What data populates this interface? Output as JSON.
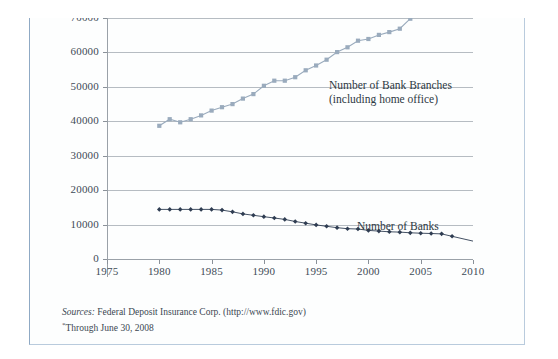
{
  "chart_data": {
    "type": "line",
    "title": "",
    "xlabel": "",
    "ylabel": "",
    "xlim": [
      1975,
      2010
    ],
    "ylim": [
      0,
      75000
    ],
    "y_axis_display_max": 70000,
    "grid": true,
    "legend_position": "inline-annotation",
    "x_ticks": [
      1975,
      1980,
      1985,
      1990,
      1995,
      2000,
      2005,
      2010
    ],
    "y_ticks": [
      0,
      10000,
      20000,
      30000,
      40000,
      50000,
      60000,
      70000
    ],
    "x_tick_labels": [
      "1975",
      "1980",
      "1985",
      "1990",
      "1995",
      "2000",
      "2005",
      "2010"
    ],
    "y_tick_labels": [
      "0",
      "10000",
      "20000",
      "30000",
      "40000",
      "50000",
      "60000",
      "70000"
    ],
    "x": [
      1980,
      1981,
      1982,
      1983,
      1984,
      1985,
      1986,
      1987,
      1988,
      1989,
      1990,
      1991,
      1992,
      1993,
      1994,
      1995,
      1996,
      1997,
      1998,
      1999,
      2000,
      2001,
      2002,
      2003,
      2004,
      2005,
      2006,
      2007,
      2008
    ],
    "series": [
      {
        "name": "Number of Bank Branches (including home office)",
        "color": "#9aabbd",
        "marker": "square",
        "values": [
          38700,
          40600,
          39700,
          40600,
          41700,
          43100,
          44100,
          45000,
          46600,
          47900,
          50300,
          51800,
          51800,
          52800,
          54800,
          56200,
          57900,
          60100,
          61500,
          63400,
          63900,
          65100,
          65900,
          66900,
          69800,
          72500,
          73400,
          75000,
          76000
        ]
      },
      {
        "name": "Number of Banks",
        "color": "#2f3d52",
        "marker": "diamond",
        "values": [
          14400,
          14400,
          14400,
          14400,
          14400,
          14400,
          14200,
          13700,
          13100,
          12700,
          12300,
          11900,
          11500,
          10900,
          10400,
          9900,
          9500,
          9100,
          8800,
          8700,
          8300,
          8100,
          7900,
          7800,
          7600,
          7500,
          7400,
          7300,
          6600
        ]
      }
    ],
    "annotations": [
      {
        "id": "branches-label",
        "line1": "Number of Bank Branches",
        "line2": "(including home office)",
        "x_px": 329,
        "y_px": 78
      },
      {
        "id": "banks-label",
        "line1": "Number of Banks",
        "line2": "",
        "x_px": 357,
        "y_px": 219
      }
    ]
  },
  "footer": {
    "sources_word": "Sources:",
    "sources_text": "Federal Deposit Insurance Corp. (http://www.fdic.gov)",
    "footnote_marker": "*",
    "footnote_text": "Through June 30, 2008"
  }
}
